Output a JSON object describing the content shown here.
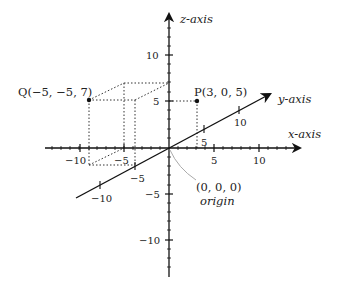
{
  "diagram": {
    "axes": {
      "x": {
        "label": "x-axis",
        "ticks": [
          "-10",
          "-5",
          "5",
          "10"
        ]
      },
      "y": {
        "label": "y-axis",
        "ticks": [
          "-10",
          "-5",
          "5",
          "10"
        ]
      },
      "z": {
        "label": "z-axis",
        "ticks": [
          "10",
          "5",
          "-5",
          "-10"
        ]
      }
    },
    "points": [
      {
        "name": "P",
        "label": "P(3, 0, 5)",
        "coords": [
          3,
          0,
          5
        ]
      },
      {
        "name": "Q",
        "label": "Q(−5, −5, 7)",
        "coords": [
          -5,
          -5,
          7
        ]
      }
    ],
    "origin": {
      "coords_label": "(0, 0, 0)",
      "name_label": "origin"
    },
    "ticks": {
      "x_neg10": "−10",
      "x_neg5": "−5",
      "x_5": "5",
      "x_10": "10",
      "y_neg10": "−10",
      "y_neg5": "−5",
      "y_5": "5",
      "y_10": "10",
      "z_10": "10",
      "z_5": "5",
      "z_neg5": "−5",
      "z_neg10": "−10"
    },
    "colors": {
      "axis": "#111111",
      "dotted": "#333333",
      "leader": "#aaaaaa"
    }
  }
}
